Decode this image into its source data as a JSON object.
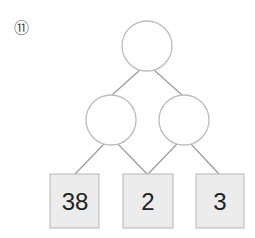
{
  "problem": {
    "number_label": "⑪"
  },
  "tree": {
    "top_node": {
      "value": ""
    },
    "middle_nodes": [
      {
        "value": ""
      },
      {
        "value": ""
      }
    ],
    "leaves": [
      {
        "value": "38"
      },
      {
        "value": "2"
      },
      {
        "value": "3"
      }
    ]
  },
  "colors": {
    "line": "#9a9a9a",
    "circle_stroke": "#bdbdbd",
    "box_fill": "#ececec",
    "box_stroke": "#b5b5b5"
  }
}
